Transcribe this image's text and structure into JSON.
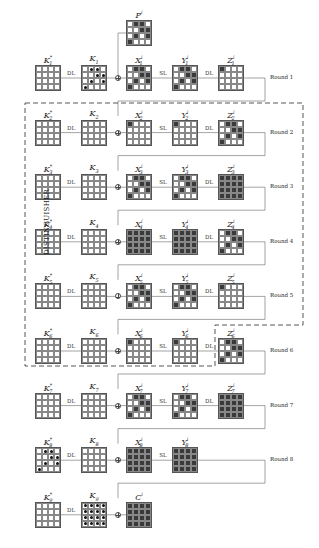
{
  "diagram": {
    "side_label": "DISTINGUISHER",
    "operations": {
      "dl": "DL",
      "sl": "SL"
    },
    "patterns": {
      "empty": [
        [
          0,
          0,
          0,
          0
        ],
        [
          0,
          0,
          0,
          0
        ],
        [
          0,
          0,
          0,
          0
        ],
        [
          0,
          0,
          0,
          0
        ]
      ],
      "single": [
        [
          1,
          0,
          0,
          0
        ],
        [
          0,
          0,
          0,
          0
        ],
        [
          0,
          0,
          0,
          0
        ],
        [
          0,
          0,
          0,
          0
        ]
      ],
      "diag": [
        [
          0,
          1,
          1,
          0
        ],
        [
          0,
          0,
          1,
          1
        ],
        [
          0,
          1,
          0,
          1
        ],
        [
          1,
          0,
          0,
          0
        ]
      ],
      "full": [
        [
          1,
          1,
          1,
          1
        ],
        [
          1,
          1,
          1,
          1
        ],
        [
          1,
          1,
          1,
          1
        ],
        [
          1,
          1,
          1,
          1
        ]
      ],
      "dots_diag": [
        [
          0,
          1,
          1,
          0
        ],
        [
          0,
          0,
          1,
          1
        ],
        [
          0,
          1,
          0,
          1
        ],
        [
          1,
          0,
          0,
          0
        ]
      ],
      "dots_full": [
        [
          1,
          1,
          1,
          1
        ],
        [
          1,
          1,
          1,
          1
        ],
        [
          1,
          1,
          1,
          1
        ],
        [
          1,
          1,
          1,
          1
        ]
      ]
    },
    "plaintext": {
      "label": "P^i",
      "pattern": "diag"
    },
    "rounds": [
      {
        "round": "Round 1",
        "kstar": "K*1",
        "k": "K1",
        "kstar_pat": "empty",
        "k_dots": "dots_diag",
        "x": "X^i_1",
        "x_pat": "diag",
        "y": "Y^i_1",
        "y_pat": "diag",
        "z": "Z^i_1",
        "z_pat": "single"
      },
      {
        "round": "Round 2",
        "kstar": "K*2",
        "k": "K2",
        "kstar_pat": "empty",
        "k_dots": null,
        "x": "X^i_2",
        "x_pat": "single",
        "y": "Y^i_2",
        "y_pat": "single",
        "z": "Z^i_2",
        "z_pat": "diag"
      },
      {
        "round": "Round 3",
        "kstar": "K*3",
        "k": "K3",
        "kstar_pat": "empty",
        "k_dots": null,
        "x": "X^i_3",
        "x_pat": "diag",
        "y": "Y^i_3",
        "y_pat": "diag",
        "z": "Z^i_3",
        "z_pat": "full"
      },
      {
        "round": "Round 4",
        "kstar": "K*4",
        "k": "K4",
        "kstar_pat": "empty",
        "k_dots": null,
        "x": "X^i_4",
        "x_pat": "full",
        "y": "Y^i_4",
        "y_pat": "full",
        "z": "Z^i_4",
        "z_pat": "diag"
      },
      {
        "round": "Round 5",
        "kstar": "K*5",
        "k": "K5",
        "kstar_pat": "empty",
        "k_dots": null,
        "x": "X^i_5",
        "x_pat": "diag",
        "y": "Y^i_5",
        "y_pat": "diag",
        "z": "Z^i_5",
        "z_pat": "single"
      },
      {
        "round": "Round 6",
        "kstar": "K*6",
        "k": "K6",
        "kstar_pat": "empty",
        "k_dots": null,
        "x": "X^i_6",
        "x_pat": "single",
        "y": "Y^i_6",
        "y_pat": "single",
        "z": "Z^i_6",
        "z_pat": "diag"
      },
      {
        "round": "Round 7",
        "kstar": "K*7",
        "k": "K7",
        "kstar_pat": "empty",
        "k_dots": null,
        "x": "X^i_7",
        "x_pat": "diag",
        "y": "Y^i_7",
        "y_pat": "diag",
        "z": "Z^i_7",
        "z_pat": "full"
      },
      {
        "round": "Round 8",
        "kstar": "K*8",
        "k": "K8",
        "kstar_pat": "empty",
        "kstar_dots": "dots_diag",
        "k_dots": null,
        "x": "X^i_8",
        "x_pat": "full",
        "y": "Y^i_8",
        "y_pat": "full",
        "z": null,
        "z_pat": null
      }
    ],
    "final": {
      "kstar": "K*9",
      "k": "K9",
      "k_dots": "dots_full",
      "c": "C^i",
      "c_pat": "full"
    }
  }
}
